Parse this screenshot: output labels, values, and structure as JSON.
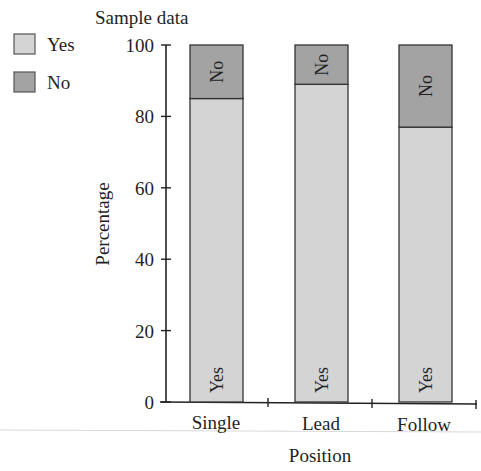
{
  "chart_data": {
    "type": "bar",
    "stacked": true,
    "title": "Sample data",
    "xlabel": "Position",
    "ylabel": "Percentage",
    "ylim": [
      0,
      100
    ],
    "yticks": [
      0,
      20,
      40,
      60,
      80,
      100
    ],
    "categories": [
      "Single",
      "Lead",
      "Follow"
    ],
    "series": [
      {
        "name": "Yes",
        "values": [
          85,
          89,
          77
        ],
        "color": "#d4d4d4"
      },
      {
        "name": "No",
        "values": [
          15,
          11,
          23
        ],
        "color": "#a3a3a3"
      }
    ],
    "grid": false,
    "legend_position": "top-left",
    "bar_segment_labels": true
  },
  "title": "Sample data",
  "legend": [
    {
      "label": "Yes",
      "color": "#d4d4d4"
    },
    {
      "label": "No",
      "color": "#a3a3a3"
    }
  ],
  "axes": {
    "x_title": "Position",
    "y_title": "Percentage",
    "y_ticks": [
      "0",
      "20",
      "40",
      "60",
      "80",
      "100"
    ],
    "categories": [
      "Single",
      "Lead",
      "Follow"
    ]
  },
  "bar_labels": {
    "yes": "Yes",
    "no": "No"
  }
}
